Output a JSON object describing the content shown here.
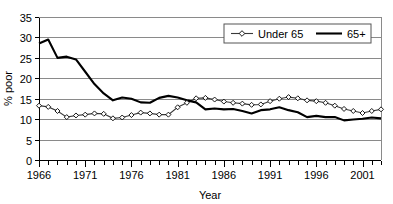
{
  "chart_data": {
    "type": "line",
    "title": "",
    "xlabel": "Year",
    "ylabel": "% poor",
    "xlim": [
      1966,
      2003
    ],
    "ylim": [
      0,
      35
    ],
    "ytick_step": 5,
    "yticks": [
      0,
      5,
      10,
      15,
      20,
      25,
      30,
      35
    ],
    "ytick_labels": [
      "0",
      "5",
      "10",
      "15",
      "20",
      "25",
      "30",
      "35"
    ],
    "xticks_labeled": [
      1966,
      1971,
      1976,
      1981,
      1986,
      1991,
      1996,
      2001
    ],
    "xtick_labels": [
      "1966",
      "1971",
      "1976",
      "1981",
      "1986",
      "1991",
      "1996",
      "2001"
    ],
    "xtick_minor_step": 1,
    "grid": "horizontal",
    "legend_position": "top-right",
    "x": [
      1966,
      1967,
      1968,
      1969,
      1970,
      1971,
      1972,
      1973,
      1974,
      1975,
      1976,
      1977,
      1978,
      1979,
      1980,
      1981,
      1982,
      1983,
      1984,
      1985,
      1986,
      1987,
      1988,
      1989,
      1990,
      1991,
      1992,
      1993,
      1994,
      1995,
      1996,
      1997,
      1998,
      1999,
      2000,
      2001,
      2002,
      2003
    ],
    "series": [
      {
        "name": "Under 65",
        "marker": "diamond",
        "color": "#3a3a3a",
        "values": [
          13.3,
          13.0,
          12.0,
          10.5,
          10.9,
          11.1,
          11.4,
          11.3,
          10.2,
          10.4,
          11.0,
          11.6,
          11.4,
          11.1,
          11.1,
          12.9,
          14.0,
          15.1,
          15.2,
          14.8,
          14.3,
          14.0,
          13.8,
          13.5,
          13.6,
          14.4,
          15.0,
          15.4,
          15.1,
          14.6,
          14.4,
          14.0,
          13.3,
          12.5,
          12.0,
          11.5,
          12.0,
          12.4
        ]
      },
      {
        "name": "65+",
        "marker": "none",
        "color": "#000000",
        "values": [
          28.5,
          29.5,
          25.0,
          25.3,
          24.6,
          21.6,
          18.6,
          16.3,
          14.6,
          15.3,
          15.0,
          14.1,
          14.0,
          15.2,
          15.7,
          15.3,
          14.6,
          14.1,
          12.4,
          12.6,
          12.4,
          12.5,
          12.0,
          11.4,
          12.2,
          12.4,
          12.9,
          12.2,
          11.7,
          10.5,
          10.8,
          10.5,
          10.5,
          9.7,
          9.9,
          10.1,
          10.4,
          10.2
        ]
      }
    ]
  }
}
